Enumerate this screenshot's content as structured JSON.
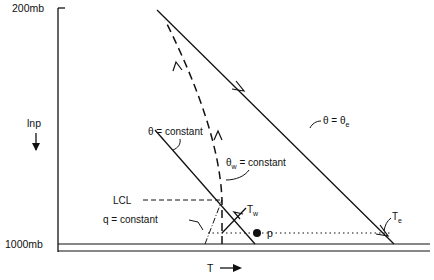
{
  "diagram": {
    "type": "thermodynamic-diagram",
    "axes": {
      "y_label": "lnp",
      "y_top_label": "200mb",
      "y_bottom_label": "1000mb",
      "x_label": "T"
    },
    "labels": {
      "theta_e": "θ = θ",
      "theta_e_sub": "e",
      "theta_const": "θ = constant",
      "theta_w": "θ",
      "theta_w_sub": "w",
      "theta_w_rest": " = constant",
      "lcl": "LCL",
      "q_const": "q = constant",
      "tw": "T",
      "tw_sub": "w",
      "te": "T",
      "te_sub": "e",
      "p": "p"
    },
    "colors": {
      "ink": "#111111",
      "background": "#ffffff"
    }
  }
}
